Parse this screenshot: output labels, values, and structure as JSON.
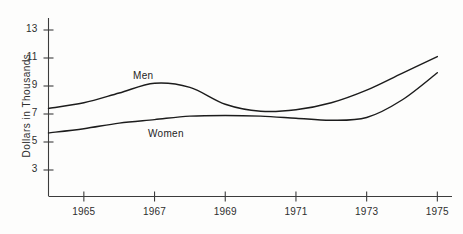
{
  "chart_data": {
    "type": "line",
    "title": "",
    "xlabel": "",
    "ylabel": "Dollars in Thousands",
    "xlim": [
      1964,
      1975
    ],
    "ylim": [
      2,
      13.6
    ],
    "grid": false,
    "legend": "inline-labels",
    "xticks": [
      "1965",
      "1967",
      "1969",
      "1971",
      "1973",
      "1975"
    ],
    "xtick_values": [
      1965,
      1967,
      1969,
      1971,
      1973,
      1975
    ],
    "yticks": [
      "3",
      "5",
      "7",
      "9",
      "11",
      "13"
    ],
    "ytick_values": [
      3,
      5,
      7,
      9,
      11,
      13
    ],
    "x": [
      1964,
      1965,
      1966,
      1967,
      1968,
      1969,
      1970,
      1971,
      1972,
      1973,
      1974,
      1975
    ],
    "series": [
      {
        "name": "Men",
        "label": "Men",
        "values": [
          7.4,
          7.8,
          8.5,
          9.2,
          8.9,
          7.7,
          7.2,
          7.3,
          7.8,
          8.7,
          9.9,
          11.1
        ]
      },
      {
        "name": "Women",
        "label": "Women",
        "values": [
          5.65,
          5.95,
          6.35,
          6.6,
          6.85,
          6.9,
          6.85,
          6.7,
          6.55,
          6.75,
          8.0,
          9.95
        ]
      }
    ]
  },
  "annotations": {
    "men_label": "Men",
    "women_label": "Women"
  }
}
